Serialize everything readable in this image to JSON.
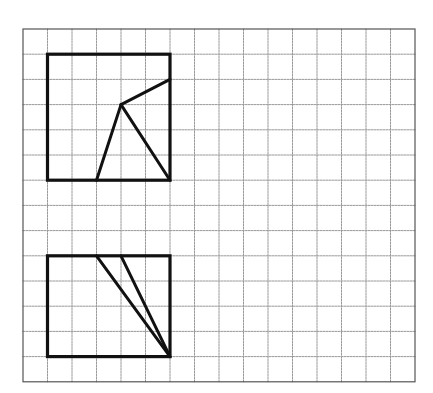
{
  "diagram": {
    "type": "grid-geometry",
    "grid": {
      "columns": 16,
      "rows": 14,
      "origin_px": [
        23,
        29
      ],
      "cell_w": 24.5,
      "cell_h": 25.2,
      "line_color": "#9a9a9a",
      "border_color": "#555555"
    },
    "figures": [
      {
        "name": "upper-figure",
        "rect": {
          "col0": 1,
          "row0": 1,
          "col1": 6,
          "row1": 6
        },
        "segments": [
          {
            "from": [
              4,
              3
            ],
            "to": [
              6,
              2
            ]
          },
          {
            "from": [
              4,
              3
            ],
            "to": [
              3,
              6
            ]
          },
          {
            "from": [
              4,
              3
            ],
            "to": [
              6,
              6
            ]
          }
        ]
      },
      {
        "name": "lower-figure",
        "rect": {
          "col0": 1,
          "row0": 9,
          "col1": 6,
          "row1": 13
        },
        "segments": [
          {
            "from": [
              3,
              9
            ],
            "to": [
              6,
              13
            ]
          },
          {
            "from": [
              4,
              9
            ],
            "to": [
              6,
              13
            ]
          }
        ]
      }
    ],
    "stroke_color": "#111111"
  }
}
